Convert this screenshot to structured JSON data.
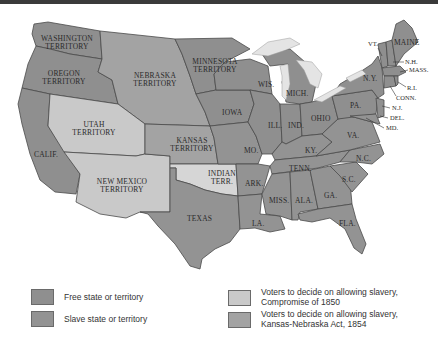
{
  "colors": {
    "free": "#8f8f8f",
    "slave": "#939393",
    "compromise_1850": "#c9c9c9",
    "kansas_nebraska": "#a3a3a3",
    "unorganized": "#d6d6d6",
    "lakes": "#e4e4e4",
    "border": "#4a4a4a"
  },
  "map": {
    "labels": {
      "washington": [
        "WASHINGTON",
        "TERRITORY"
      ],
      "oregon": [
        "OREGON",
        "TERRITORY"
      ],
      "nebraska": [
        "NEBRASKA",
        "TERRITORY"
      ],
      "minnesota": [
        "MINNESOTA",
        "TERRITORY"
      ],
      "utah": [
        "UTAH",
        "TERRITORY"
      ],
      "kansas": [
        "KANSAS",
        "TERRITORY"
      ],
      "new_mexico": [
        "NEW MEXICO",
        "TERRITORY"
      ],
      "indian": [
        "INDIAN",
        "TERR."
      ],
      "calif": "CALIF.",
      "texas": "TEXAS",
      "iowa": "IOWA",
      "wis": "WIS.",
      "mich": "MICH.",
      "ill": "ILL.",
      "ind": "IND.",
      "ohio": "OHIO",
      "mo": "MO.",
      "ky": "KY.",
      "ark": "ARK.",
      "tenn": "TENN.",
      "miss": "MISS.",
      "ala": "ALA.",
      "ga": "GA.",
      "la": "LA.",
      "fla": "FLA.",
      "sc": "S.C.",
      "nc": "N.C.",
      "va": "VA.",
      "pa": "PA.",
      "ny": "N.Y.",
      "vt": "VT.",
      "maine": "MAINE",
      "nh": "N.H.",
      "mass": "MASS.",
      "ri": "R.I.",
      "conn": "CONN.",
      "nj": "N.J.",
      "del": "DEL.",
      "md": "MD."
    }
  },
  "legend": {
    "items": [
      {
        "key": "free",
        "label_lines": [
          "Free state or territory"
        ]
      },
      {
        "key": "slave",
        "label_lines": [
          "Slave state or territory"
        ]
      },
      {
        "key": "compromise_1850",
        "label_lines": [
          "Voters to decide on allowing slavery,",
          "Compromise of 1850"
        ]
      },
      {
        "key": "kansas_nebraska",
        "label_lines": [
          "Voters to decide on allowing slavery,",
          "Kansas-Nebraska Act, 1854"
        ]
      }
    ]
  }
}
